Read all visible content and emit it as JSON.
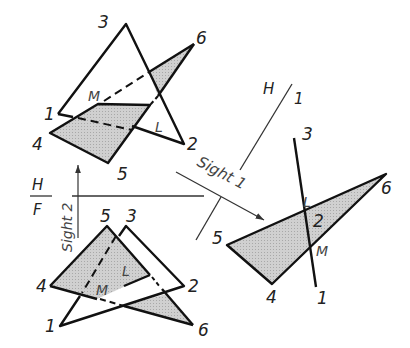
{
  "figure": {
    "shade_color": "#c8c8c8",
    "line_color": "#111111"
  },
  "top_view": {
    "plane_A_label": "1-2-3",
    "plane_B_label": "4-5-6",
    "points": {
      "p1": "1",
      "p2": "2",
      "p3": "3",
      "p4": "4",
      "p5": "5",
      "p6": "6"
    },
    "intersection": {
      "L": "L",
      "M": "M"
    }
  },
  "front_view": {
    "points": {
      "p1": "1",
      "p2": "2",
      "p3": "3",
      "p4": "4",
      "p5": "5",
      "p6": "6"
    },
    "intersection": {
      "L": "L",
      "M": "M"
    }
  },
  "aux_view": {
    "points": {
      "p1": "1",
      "p2": "2",
      "p3": "3",
      "p4": "4",
      "p5": "5",
      "p6": "6"
    },
    "intersection": {
      "L": "L",
      "M": "M"
    }
  },
  "fold_lines": {
    "hf_upper": "H",
    "hf_lower": "F",
    "h1_left": "H",
    "h1_right": "1"
  },
  "sight_arrows": {
    "sight2": "Sight 2",
    "sight1": "Sight 1"
  }
}
